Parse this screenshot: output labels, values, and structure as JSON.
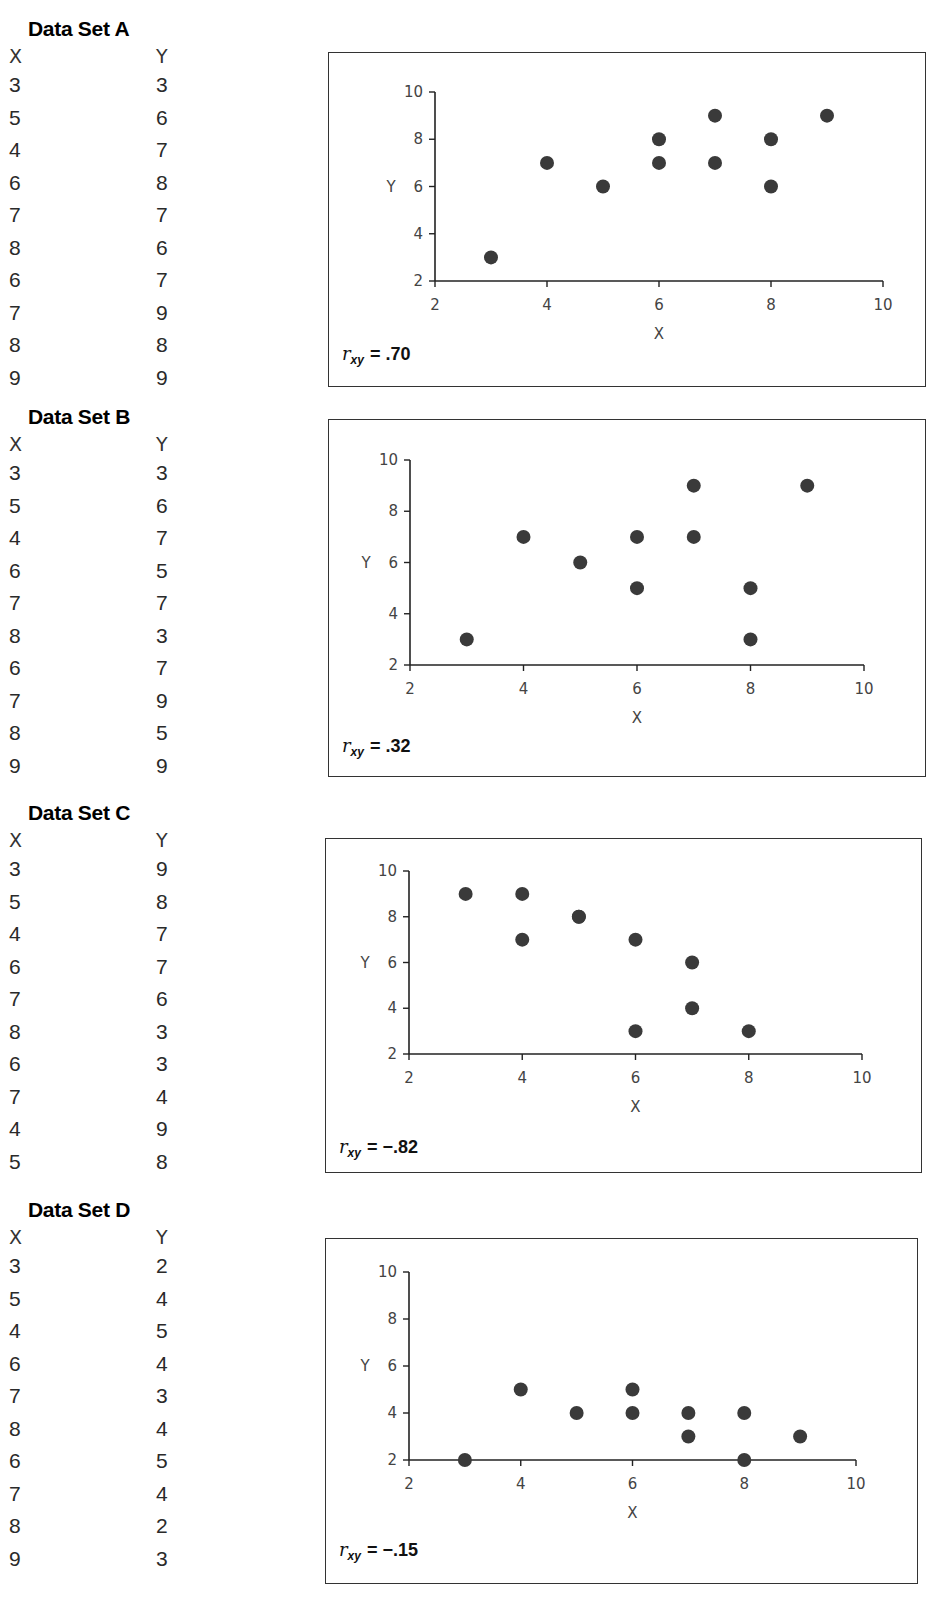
{
  "datasets": [
    {
      "title": "Data Set A",
      "x_header": "X",
      "y_header": "Y",
      "rows": [
        [
          3,
          3
        ],
        [
          5,
          6
        ],
        [
          4,
          7
        ],
        [
          6,
          8
        ],
        [
          7,
          7
        ],
        [
          8,
          6
        ],
        [
          6,
          7
        ],
        [
          7,
          9
        ],
        [
          8,
          8
        ],
        [
          9,
          9
        ]
      ],
      "r_label": "r",
      "r_sub": "xy",
      "r_value": "= .70"
    },
    {
      "title": "Data Set B",
      "x_header": "X",
      "y_header": "Y",
      "rows": [
        [
          3,
          3
        ],
        [
          5,
          6
        ],
        [
          4,
          7
        ],
        [
          6,
          5
        ],
        [
          7,
          7
        ],
        [
          8,
          3
        ],
        [
          6,
          7
        ],
        [
          7,
          9
        ],
        [
          8,
          5
        ],
        [
          9,
          9
        ]
      ],
      "r_label": "r",
      "r_sub": "xy",
      "r_value": "= .32"
    },
    {
      "title": "Data Set C",
      "x_header": "X",
      "y_header": "Y",
      "rows": [
        [
          3,
          9
        ],
        [
          5,
          8
        ],
        [
          4,
          7
        ],
        [
          6,
          7
        ],
        [
          7,
          6
        ],
        [
          8,
          3
        ],
        [
          6,
          3
        ],
        [
          7,
          4
        ],
        [
          4,
          9
        ],
        [
          5,
          8
        ]
      ],
      "r_label": "r",
      "r_sub": "xy",
      "r_value": "= −.82"
    },
    {
      "title": "Data Set D",
      "x_header": "X",
      "y_header": "Y",
      "rows": [
        [
          3,
          2
        ],
        [
          5,
          4
        ],
        [
          4,
          5
        ],
        [
          6,
          4
        ],
        [
          7,
          3
        ],
        [
          8,
          4
        ],
        [
          6,
          5
        ],
        [
          7,
          4
        ],
        [
          8,
          2
        ],
        [
          9,
          3
        ]
      ],
      "r_label": "r",
      "r_sub": "xy",
      "r_value": "= −.15"
    }
  ],
  "axes": {
    "x_label": "X",
    "y_label": "Y",
    "x_ticks": [
      2,
      4,
      6,
      8,
      10
    ],
    "y_ticks": [
      2,
      4,
      6,
      8,
      10
    ]
  },
  "colors": {
    "dot": "#3a3a3a",
    "axis": "#222222",
    "border": "#333333"
  },
  "chart_data": [
    {
      "type": "scatter",
      "title": "Data Set A",
      "xlabel": "X",
      "ylabel": "Y",
      "xlim": [
        2,
        10
      ],
      "ylim": [
        2,
        10
      ],
      "x_ticks": [
        2,
        4,
        6,
        8,
        10
      ],
      "y_ticks": [
        2,
        4,
        6,
        8,
        10
      ],
      "grid": false,
      "x": [
        3,
        5,
        4,
        6,
        7,
        8,
        6,
        7,
        8,
        9
      ],
      "y": [
        3,
        6,
        7,
        8,
        7,
        6,
        7,
        9,
        8,
        9
      ],
      "annotation": "r_xy = .70"
    },
    {
      "type": "scatter",
      "title": "Data Set B",
      "xlabel": "X",
      "ylabel": "Y",
      "xlim": [
        2,
        10
      ],
      "ylim": [
        2,
        10
      ],
      "x_ticks": [
        2,
        4,
        6,
        8,
        10
      ],
      "y_ticks": [
        2,
        4,
        6,
        8,
        10
      ],
      "grid": false,
      "x": [
        3,
        5,
        4,
        6,
        7,
        8,
        6,
        7,
        8,
        9
      ],
      "y": [
        3,
        6,
        7,
        5,
        7,
        3,
        7,
        9,
        5,
        9
      ],
      "annotation": "r_xy = .32"
    },
    {
      "type": "scatter",
      "title": "Data Set C",
      "xlabel": "X",
      "ylabel": "Y",
      "xlim": [
        2,
        10
      ],
      "ylim": [
        2,
        10
      ],
      "x_ticks": [
        2,
        4,
        6,
        8,
        10
      ],
      "y_ticks": [
        2,
        4,
        6,
        8,
        10
      ],
      "grid": false,
      "x": [
        3,
        5,
        4,
        6,
        7,
        8,
        6,
        7,
        4,
        5
      ],
      "y": [
        9,
        8,
        7,
        7,
        6,
        3,
        3,
        4,
        9,
        8
      ],
      "annotation": "r_xy = -.82"
    },
    {
      "type": "scatter",
      "title": "Data Set D",
      "xlabel": "X",
      "ylabel": "Y",
      "xlim": [
        2,
        10
      ],
      "ylim": [
        2,
        10
      ],
      "x_ticks": [
        2,
        4,
        6,
        8,
        10
      ],
      "y_ticks": [
        2,
        4,
        6,
        8,
        10
      ],
      "grid": false,
      "x": [
        3,
        5,
        4,
        6,
        7,
        8,
        6,
        7,
        8,
        9
      ],
      "y": [
        2,
        4,
        5,
        4,
        3,
        4,
        5,
        4,
        2,
        3
      ],
      "annotation": "r_xy = -.15"
    }
  ]
}
